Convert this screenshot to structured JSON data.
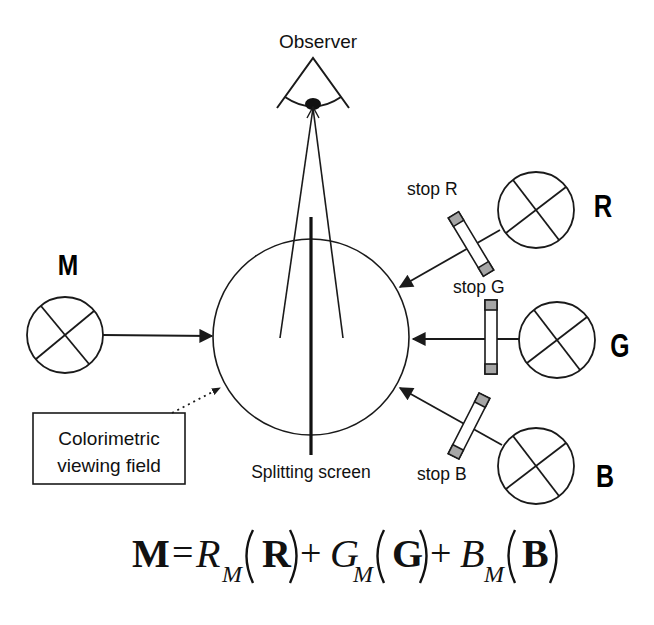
{
  "diagram": {
    "observer_label": "Observer",
    "splitting_screen_label": "Splitting screen",
    "viewing_field_label_line1": "Colorimetric",
    "viewing_field_label_line2": "viewing field",
    "lamps": {
      "M": {
        "label": "M"
      },
      "R": {
        "label": "R",
        "stop_label": "stop R"
      },
      "G": {
        "label": "G",
        "stop_label": "stop G"
      },
      "B": {
        "label": "B",
        "stop_label": "stop B"
      }
    },
    "colors": {
      "stroke": "#1a1a1a",
      "stop_fill": "#a6a6a6",
      "background": "#ffffff"
    }
  },
  "equation": {
    "lhs": "M",
    "equals": "=",
    "plus": "+",
    "terms": [
      {
        "coef": "R",
        "sub": "M",
        "primary": "R"
      },
      {
        "coef": "G",
        "sub": "M",
        "primary": "G"
      },
      {
        "coef": "B",
        "sub": "M",
        "primary": "B"
      }
    ]
  }
}
